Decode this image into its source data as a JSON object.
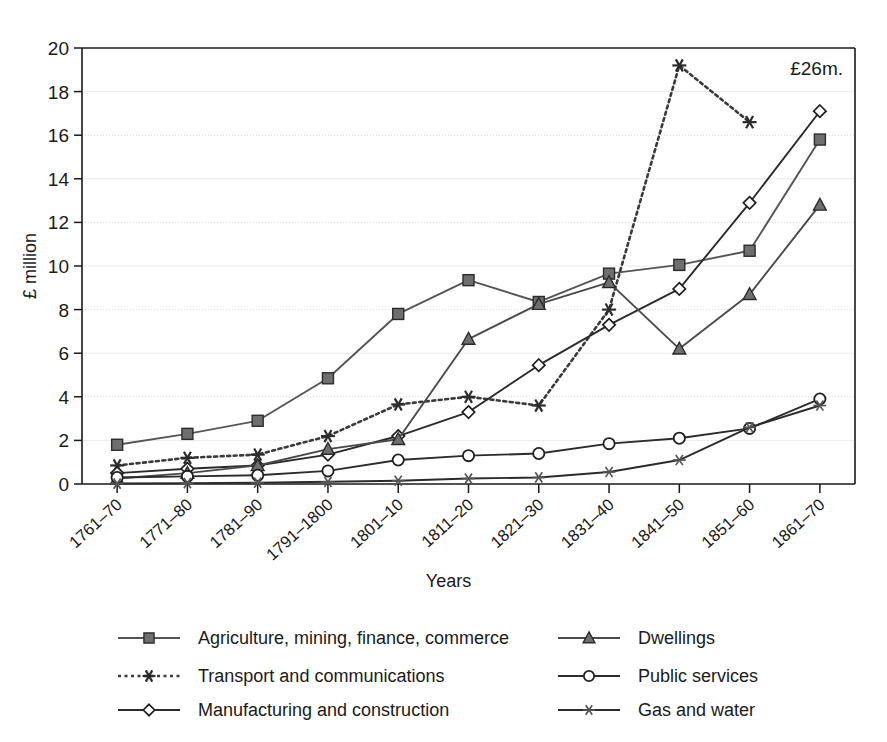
{
  "chart_data": {
    "type": "line",
    "title": "",
    "xlabel": "Years",
    "ylabel": "£ million",
    "ylim": [
      0,
      20
    ],
    "ytick_step": 2,
    "yticks": [
      0,
      2,
      4,
      6,
      8,
      10,
      12,
      14,
      16,
      18,
      20
    ],
    "grid": true,
    "legend_position": "bottom",
    "annotation": "£26m.",
    "categories": [
      "1761–70",
      "1771–80",
      "1781–90",
      "1791–1800",
      "1801–10",
      "1811–20",
      "1821–30",
      "1831–40",
      "1841–50",
      "1851–60",
      "1861–70"
    ],
    "series": [
      {
        "name": "Agriculture, mining, finance, commerce",
        "marker": "square",
        "dash": "none",
        "color": "#555555",
        "values": [
          1.8,
          2.3,
          2.9,
          4.85,
          7.8,
          9.35,
          8.35,
          9.65,
          10.05,
          10.7,
          15.8
        ]
      },
      {
        "name": "Transport and communications",
        "marker": "star",
        "dash": "dotted",
        "color": "#3a3a3a",
        "values": [
          0.85,
          1.2,
          1.35,
          2.2,
          3.65,
          4.0,
          3.6,
          8.0,
          19.2,
          16.6,
          null
        ]
      },
      {
        "name": "Manufacturing and construction",
        "marker": "diamond",
        "dash": "none",
        "color": "#2b2b2b",
        "values": [
          0.5,
          0.7,
          0.85,
          1.35,
          2.2,
          3.3,
          5.45,
          7.3,
          8.95,
          12.9,
          17.1
        ]
      },
      {
        "name": "Dwellings",
        "marker": "triangle",
        "dash": "none",
        "color": "#4a4a4a",
        "values": [
          0.25,
          0.5,
          0.85,
          1.6,
          2.05,
          6.65,
          8.25,
          9.25,
          6.2,
          8.7,
          12.8
        ]
      },
      {
        "name": "Public services",
        "marker": "circle",
        "dash": "none",
        "color": "#2b2b2b",
        "values": [
          0.3,
          0.35,
          0.4,
          0.6,
          1.1,
          1.3,
          1.4,
          1.85,
          2.1,
          2.55,
          3.9
        ]
      },
      {
        "name": "Gas and water",
        "marker": "starline",
        "dash": "none",
        "color": "#2b2b2b",
        "values": [
          0.02,
          0.04,
          0.06,
          0.1,
          0.15,
          0.25,
          0.3,
          0.55,
          1.1,
          2.6,
          3.6
        ]
      }
    ]
  },
  "legend": {
    "entries": [
      {
        "label": "Agriculture, mining, finance, commerce"
      },
      {
        "label": "Transport and communications"
      },
      {
        "label": "Manufacturing and construction"
      },
      {
        "label": "Dwellings"
      },
      {
        "label": "Public services"
      },
      {
        "label": "Gas and water"
      }
    ]
  }
}
